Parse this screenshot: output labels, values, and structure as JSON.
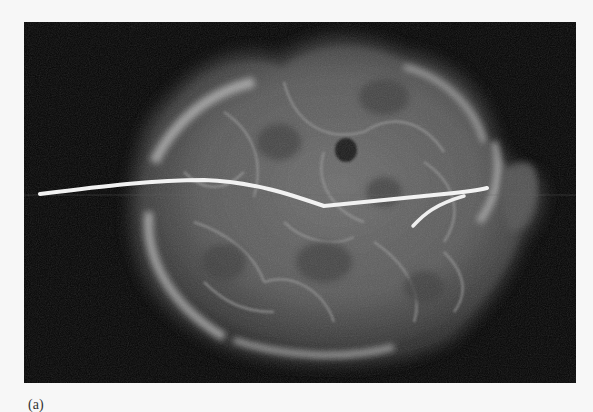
{
  "figure": {
    "caption_label": "(a)",
    "colors": {
      "background": "#050505",
      "page": "#f7f7f7",
      "wire": "#f2f2f2",
      "tissue": "#8a8a8a"
    }
  }
}
